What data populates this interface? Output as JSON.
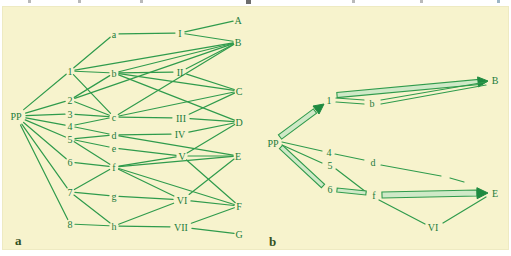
{
  "colors": {
    "panel_bg": "#f7f3cd",
    "line": "#2f9b4c",
    "text": "#1c7c3c",
    "band_fill": "#cfe9c7",
    "arrow_head": "#1e8a40",
    "panel_letter": "#33511f"
  },
  "panel_labels": {
    "a": "a",
    "b": "b"
  },
  "artifacts": [
    {
      "x": 28
    },
    {
      "x": 78
    },
    {
      "x": 140
    },
    {
      "x": 246,
      "w": 5,
      "h": 4,
      "c": "#6d6d6d"
    },
    {
      "x": 352
    },
    {
      "x": 420
    },
    {
      "x": 497,
      "c": "#9db6c6"
    }
  ],
  "diagram_a": {
    "nodes": [
      {
        "id": "PP",
        "label": "PP",
        "x": 16,
        "y": 116,
        "r": 10
      },
      {
        "id": "1",
        "label": "1",
        "x": 70,
        "y": 71,
        "r": 5
      },
      {
        "id": "2",
        "label": "2",
        "x": 70,
        "y": 100,
        "r": 5
      },
      {
        "id": "3",
        "label": "3",
        "x": 70,
        "y": 114,
        "r": 5
      },
      {
        "id": "4",
        "label": "4",
        "x": 70,
        "y": 126,
        "r": 5
      },
      {
        "id": "5",
        "label": "5",
        "x": 70,
        "y": 139,
        "r": 5
      },
      {
        "id": "6",
        "label": "6",
        "x": 70,
        "y": 162,
        "r": 5
      },
      {
        "id": "7",
        "label": "7",
        "x": 70,
        "y": 192,
        "r": 5
      },
      {
        "id": "8",
        "label": "8",
        "x": 70,
        "y": 224,
        "r": 5
      },
      {
        "id": "a",
        "label": "a",
        "x": 114,
        "y": 34,
        "r": 5
      },
      {
        "id": "b",
        "label": "b",
        "x": 114,
        "y": 73,
        "r": 5
      },
      {
        "id": "c",
        "label": "c",
        "x": 114,
        "y": 117,
        "r": 5
      },
      {
        "id": "d",
        "label": "d",
        "x": 114,
        "y": 135,
        "r": 5
      },
      {
        "id": "e",
        "label": "e",
        "x": 114,
        "y": 148,
        "r": 5
      },
      {
        "id": "f",
        "label": "f",
        "x": 114,
        "y": 167,
        "r": 5
      },
      {
        "id": "g",
        "label": "g",
        "x": 114,
        "y": 196,
        "r": 5
      },
      {
        "id": "h",
        "label": "h",
        "x": 114,
        "y": 226,
        "r": 5
      },
      {
        "id": "I",
        "label": "I",
        "x": 180,
        "y": 33,
        "r": 5
      },
      {
        "id": "II",
        "label": "II",
        "x": 180,
        "y": 72,
        "r": 7
      },
      {
        "id": "III",
        "label": "III",
        "x": 181,
        "y": 118,
        "r": 9
      },
      {
        "id": "IV",
        "label": "IV",
        "x": 180,
        "y": 134,
        "r": 9
      },
      {
        "id": "V",
        "label": "V",
        "x": 182,
        "y": 156,
        "r": 6
      },
      {
        "id": "VI",
        "label": "VI",
        "x": 182,
        "y": 200,
        "r": 9
      },
      {
        "id": "VII",
        "label": "VII",
        "x": 181,
        "y": 227,
        "r": 11
      },
      {
        "id": "A",
        "label": "A",
        "x": 238,
        "y": 20,
        "r": 5
      },
      {
        "id": "B",
        "label": "B",
        "x": 238,
        "y": 42,
        "r": 5
      },
      {
        "id": "C",
        "label": "C",
        "x": 239,
        "y": 91,
        "r": 5
      },
      {
        "id": "D",
        "label": "D",
        "x": 239,
        "y": 122,
        "r": 5
      },
      {
        "id": "E",
        "label": "E",
        "x": 238,
        "y": 156,
        "r": 5
      },
      {
        "id": "F",
        "label": "F",
        "x": 239,
        "y": 206,
        "r": 5
      },
      {
        "id": "G",
        "label": "G",
        "x": 239,
        "y": 234,
        "r": 5
      }
    ],
    "edges": [
      [
        "PP",
        "1"
      ],
      [
        "PP",
        "2"
      ],
      [
        "PP",
        "3"
      ],
      [
        "PP",
        "4"
      ],
      [
        "PP",
        "5"
      ],
      [
        "PP",
        "6"
      ],
      [
        "PP",
        "7"
      ],
      [
        "PP",
        "8"
      ],
      [
        "1",
        "a"
      ],
      [
        "1",
        "b"
      ],
      [
        "1",
        "c"
      ],
      [
        "1",
        "B"
      ],
      [
        "2",
        "b"
      ],
      [
        "2",
        "c"
      ],
      [
        "2",
        "B"
      ],
      [
        "3",
        "c"
      ],
      [
        "4",
        "c"
      ],
      [
        "4",
        "d"
      ],
      [
        "5",
        "d"
      ],
      [
        "5",
        "e"
      ],
      [
        "5",
        "f"
      ],
      [
        "6",
        "f"
      ],
      [
        "7",
        "f"
      ],
      [
        "7",
        "g"
      ],
      [
        "7",
        "h"
      ],
      [
        "8",
        "h"
      ],
      [
        "a",
        "I"
      ],
      [
        "b",
        "II"
      ],
      [
        "b",
        "B"
      ],
      [
        "b",
        "C"
      ],
      [
        "b",
        "D"
      ],
      [
        "c",
        "III"
      ],
      [
        "c",
        "B"
      ],
      [
        "c",
        "C"
      ],
      [
        "d",
        "IV"
      ],
      [
        "d",
        "E"
      ],
      [
        "e",
        "V"
      ],
      [
        "f",
        "V"
      ],
      [
        "f",
        "E"
      ],
      [
        "f",
        "VI"
      ],
      [
        "f",
        "F"
      ],
      [
        "g",
        "VI"
      ],
      [
        "h",
        "VI"
      ],
      [
        "h",
        "VII"
      ],
      [
        "I",
        "A"
      ],
      [
        "I",
        "B"
      ],
      [
        "II",
        "B"
      ],
      [
        "II",
        "C"
      ],
      [
        "III",
        "C"
      ],
      [
        "III",
        "D"
      ],
      [
        "IV",
        "D"
      ],
      [
        "V",
        "D"
      ],
      [
        "V",
        "E"
      ],
      [
        "V",
        "F"
      ],
      [
        "VI",
        "E"
      ],
      [
        "VI",
        "F"
      ],
      [
        "VII",
        "F"
      ],
      [
        "VII",
        "G"
      ]
    ]
  },
  "diagram_b": {
    "nodes": [
      {
        "id": "PP",
        "label": "PP",
        "x": 273,
        "y": 143
      },
      {
        "id": "1",
        "label": "1",
        "x": 329,
        "y": 100
      },
      {
        "id": "b",
        "label": "b",
        "x": 372,
        "y": 103
      },
      {
        "id": "B",
        "label": "B",
        "x": 495,
        "y": 80
      },
      {
        "id": "4",
        "label": "4",
        "x": 329,
        "y": 152
      },
      {
        "id": "5",
        "label": "5",
        "x": 330,
        "y": 165
      },
      {
        "id": "6",
        "label": "6",
        "x": 330,
        "y": 189
      },
      {
        "id": "d",
        "label": "d",
        "x": 373,
        "y": 162
      },
      {
        "id": "f",
        "label": "f",
        "x": 374,
        "y": 195
      },
      {
        "id": "E",
        "label": "E",
        "x": 495,
        "y": 193
      },
      {
        "id": "VI",
        "label": "VI",
        "x": 433,
        "y": 227
      }
    ],
    "elements": [
      {
        "name": "pp-to-1-band-arrow",
        "type": "band_arrow",
        "x1": 280,
        "y1": 137,
        "x2": 315,
        "y2": 111,
        "hw": 2.6,
        "tipx": 324,
        "tipy": 104,
        "head": 10
      },
      {
        "name": "pp-4-line",
        "type": "line",
        "x1": 282,
        "y1": 142,
        "x2": 322,
        "y2": 151
      },
      {
        "name": "pp-5-line",
        "type": "line",
        "x1": 282,
        "y1": 145,
        "x2": 322,
        "y2": 163
      },
      {
        "name": "pp-to-6-band",
        "type": "band",
        "x1": 281,
        "y1": 147,
        "x2": 323,
        "y2": 186,
        "hw": 2.3
      },
      {
        "name": "1-b-double-top",
        "type": "line",
        "x1": 336,
        "y1": 98,
        "x2": 364,
        "y2": 100
      },
      {
        "name": "1-b-double-bottom",
        "type": "line",
        "x1": 336,
        "y1": 102,
        "x2": 364,
        "y2": 104
      },
      {
        "name": "1-to-B-band-arrow",
        "type": "band_arrow",
        "x1": 337,
        "y1": 95,
        "x2": 479,
        "y2": 82,
        "hw": 2.6,
        "tipx": 488,
        "tipy": 81,
        "head": 10
      },
      {
        "name": "b-B-double-top",
        "type": "line",
        "x1": 381,
        "y1": 100,
        "x2": 486,
        "y2": 82
      },
      {
        "name": "b-B-double-bottom",
        "type": "line",
        "x1": 381,
        "y1": 104,
        "x2": 486,
        "y2": 85
      },
      {
        "name": "4-d-line",
        "type": "line",
        "x1": 335,
        "y1": 154,
        "x2": 364,
        "y2": 160
      },
      {
        "name": "d-E-dashed-segment-1",
        "type": "line",
        "x1": 381,
        "y1": 165,
        "x2": 441,
        "y2": 176
      },
      {
        "name": "d-E-dashed-segment-2",
        "type": "line",
        "x1": 450,
        "y1": 178,
        "x2": 464,
        "y2": 182
      },
      {
        "name": "5-f-line",
        "type": "line",
        "x1": 336,
        "y1": 169,
        "x2": 366,
        "y2": 192
      },
      {
        "name": "6-to-f-band",
        "type": "band",
        "x1": 337,
        "y1": 190,
        "x2": 366,
        "y2": 193,
        "hw": 2
      },
      {
        "name": "f-to-E-band-arrow",
        "type": "band_arrow",
        "x1": 382,
        "y1": 195,
        "x2": 477,
        "y2": 193,
        "hw": 3,
        "tipx": 488,
        "tipy": 193,
        "head": 11
      },
      {
        "name": "f-VI-line",
        "type": "line",
        "x1": 379,
        "y1": 200,
        "x2": 425,
        "y2": 224
      },
      {
        "name": "VI-E-line",
        "type": "line",
        "x1": 443,
        "y1": 223,
        "x2": 486,
        "y2": 197
      }
    ]
  }
}
